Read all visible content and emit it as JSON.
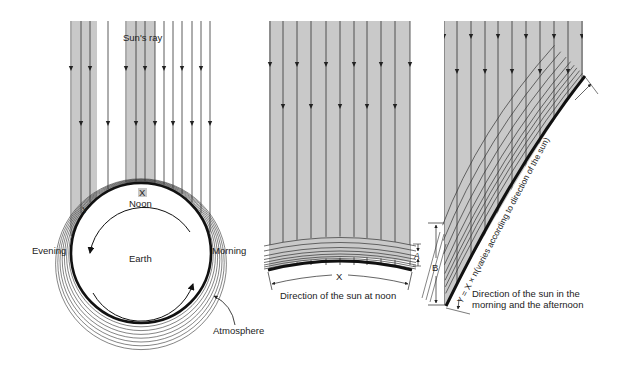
{
  "colors": {
    "background": "#ffffff",
    "shade": "#c9c9c9",
    "line": "#333333",
    "earth_outline": "#111111"
  },
  "panel_left": {
    "title": "Sun's ray",
    "noon_label": "Noon",
    "x_marker": "X",
    "y_marker": "Y",
    "evening_label": "Evening",
    "morning_label": "Morning",
    "earth_label": "Earth",
    "atmosphere_label": "Atmosphere",
    "shaded_bands": [
      [
        72,
        97
      ],
      [
        127,
        155
      ]
    ],
    "ray_x": [
      71,
      81,
      90,
      108,
      126,
      136,
      145,
      155,
      164,
      173,
      182,
      192,
      201,
      210
    ],
    "ray_top": 21,
    "earth": {
      "cx": 141,
      "cy": 253,
      "r": 70
    },
    "atmosphere_rings": 7
  },
  "panel_middle": {
    "caption": "Direction of the sun at noon",
    "x_marker": "X",
    "a_marker": "A",
    "shaded_rect": [
      269,
      21,
      410,
      290
    ],
    "ray_x": [
      270,
      283,
      297,
      311,
      326,
      340,
      354,
      367,
      381,
      395,
      410
    ],
    "layers": 8
  },
  "panel_right": {
    "caption_line1": "Direction of the sun in the",
    "caption_line2": "morning and the afternoon",
    "formula": "Y = X × n(varies according to direction of the sun)",
    "b_marker": "B",
    "shaded_left": 444,
    "shaded_right": 583,
    "ray_top": 21,
    "ray_x": [
      444,
      457,
      471,
      485,
      498,
      512,
      526,
      540,
      554,
      568,
      582
    ],
    "layers": 8
  }
}
